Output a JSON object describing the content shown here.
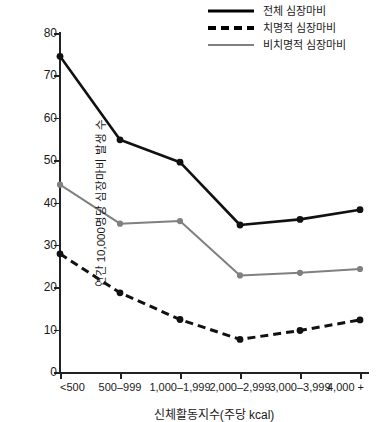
{
  "chart_data": {
    "type": "line",
    "title": "",
    "xlabel": "신체활동지수(주당 kcal)",
    "ylabel": "연간 10,000명당 심장마비 발생 수",
    "categories": [
      "<500",
      "500–999",
      "1,000–1,999",
      "2,000–2,999",
      "3,000–3,999",
      "4,000 +"
    ],
    "ylim": [
      0,
      80
    ],
    "yticks": [
      0,
      10,
      20,
      30,
      40,
      50,
      60,
      70,
      80
    ],
    "grid": false,
    "legend_position": "top-right",
    "series": [
      {
        "name": "전체 심장마비",
        "style": "solid",
        "color": "#111111",
        "values": [
          74.5,
          54.8,
          49.5,
          34.7,
          36.0,
          38.3
        ]
      },
      {
        "name": "치명적 심장마비",
        "style": "dashed",
        "color": "#111111",
        "values": [
          27.9,
          18.7,
          12.4,
          7.7,
          9.8,
          12.3
        ]
      },
      {
        "name": "비치명적 심장마비",
        "style": "solid",
        "color": "#808080",
        "values": [
          44.2,
          35.0,
          35.6,
          22.8,
          23.4,
          24.3
        ]
      }
    ]
  },
  "legend": {
    "items": [
      {
        "label": "전체 심장마비",
        "swatch": "solid-black-line-icon"
      },
      {
        "label": "치명적 심장마비",
        "swatch": "dashed-black-line-icon"
      },
      {
        "label": "비치명적 심장마비",
        "swatch": "solid-gray-line-icon"
      }
    ]
  },
  "footer": {
    "caption": ""
  }
}
